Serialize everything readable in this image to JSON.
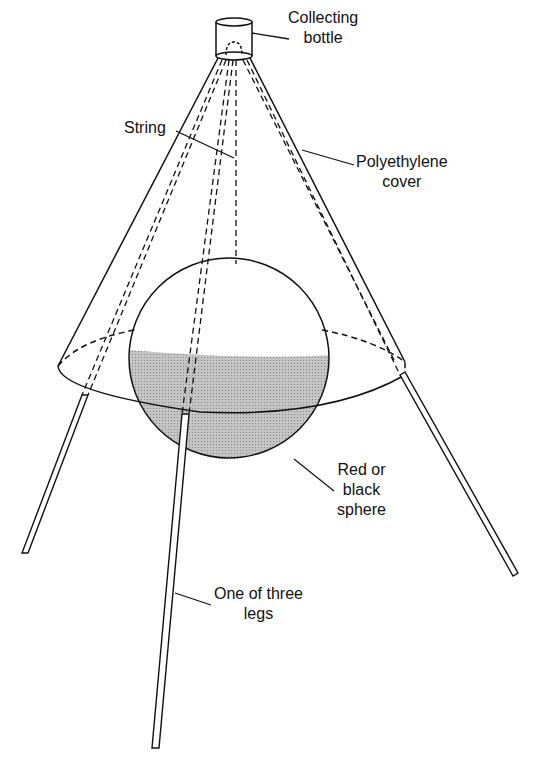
{
  "diagram": {
    "type": "apparatus-illustration",
    "colors": {
      "stroke": "#111111",
      "sphere_shade": "#b8b8b8",
      "background": "#ffffff"
    },
    "labels": {
      "collecting_bottle": [
        "Collecting",
        "bottle"
      ],
      "string": [
        "String"
      ],
      "polyethylene_cover": [
        "Polyethylene",
        "cover"
      ],
      "sphere": [
        "Red or",
        "black",
        "sphere"
      ],
      "leg": [
        "One of three",
        "legs"
      ]
    }
  }
}
